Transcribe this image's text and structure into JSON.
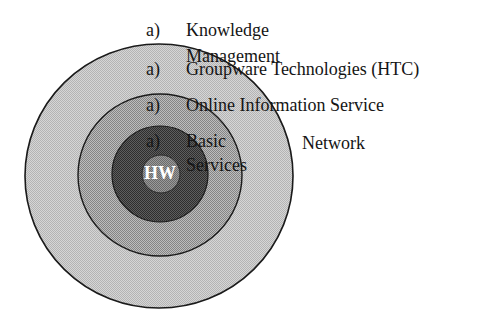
{
  "diagram": {
    "title": "",
    "colors": {
      "background": "#ffffff",
      "outer_ring": "#c9c9c9",
      "middle_ring": "#a3a3a3",
      "inner_ring": "#4a4a4a",
      "core": "#808080",
      "outline": "#1a1a1a",
      "text": "#151515",
      "core_text": "#ffffff"
    },
    "rings": [
      {
        "id": "knowledge-management-ring",
        "level": 4,
        "cx": 159,
        "cy": 176,
        "rx": 134,
        "ry": 132
      },
      {
        "id": "groupware-ring",
        "level": 3,
        "cx": 160,
        "cy": 175,
        "rx": 82,
        "ry": 81
      },
      {
        "id": "online-information-ring",
        "level": 2,
        "cx": 160,
        "cy": 174,
        "rx": 48,
        "ry": 48
      },
      {
        "id": "hardware-core",
        "level": 1,
        "cx": 161,
        "cy": 174,
        "rx": 19,
        "ry": 19
      }
    ],
    "core_label": "HW",
    "labels": [
      {
        "marker": "a)",
        "lines": [
          "Knowledge",
          "Management"
        ]
      },
      {
        "marker": "a)",
        "lines": [
          "Groupware Technologies (HTC)"
        ]
      },
      {
        "marker": "a)",
        "lines": [
          "Online Information Service"
        ]
      },
      {
        "marker": "a)",
        "lines": [
          "Basic",
          "Services"
        ],
        "suffix": "Network"
      }
    ]
  }
}
